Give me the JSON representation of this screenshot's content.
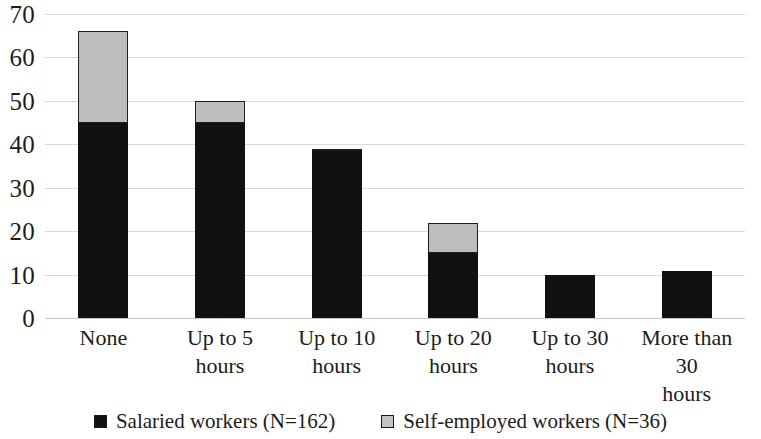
{
  "chart_data": {
    "type": "bar",
    "subtype": "stacked-bar",
    "title": "",
    "subtitle": "",
    "xlabel": "",
    "ylabel": "",
    "ylim": [
      0,
      70
    ],
    "ytick_step": 10,
    "yticks": [
      "70",
      "60",
      "50",
      "40",
      "30",
      "20",
      "10",
      "0"
    ],
    "grid": true,
    "grid_axis": "y",
    "legend_position": "bottom",
    "categories": [
      "None",
      "Up to 5\nhours",
      "Up to 10\nhours",
      "Up to 20\nhours",
      "Up to 30\nhours",
      "More than 30\nhours"
    ],
    "series": [
      {
        "name": "Salaried workers (N=162)",
        "color": "#111111",
        "values": [
          45,
          45,
          38.5,
          15,
          10,
          10.8
        ]
      },
      {
        "name": "Self-employed workers (N=36)",
        "color": "#bdbdbd",
        "values": [
          21,
          5,
          0.5,
          6.8,
          0,
          0
        ]
      }
    ],
    "totals": [
      66,
      50,
      39,
      21.8,
      10,
      10.8
    ]
  },
  "legend": {
    "items": [
      {
        "label": "Salaried workers (N=162)",
        "swatch": "black-square-marker"
      },
      {
        "label": "Self-employed workers (N=36)",
        "swatch": "gray-square-marker"
      }
    ]
  }
}
